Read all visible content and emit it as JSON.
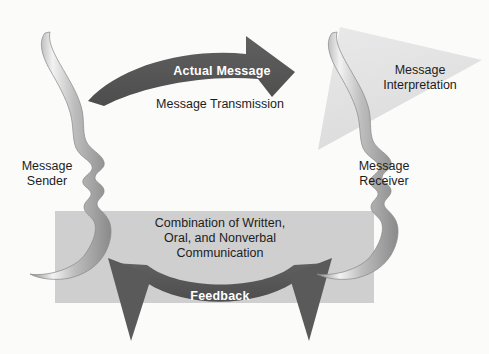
{
  "diagram": {
    "background_color": "#fbfbfa",
    "nodes": {
      "sender": {
        "label": "Message\nSender",
        "role": "human profile silhouette facing right",
        "side": "left"
      },
      "receiver": {
        "label": "Message\nReceiver",
        "role": "human profile silhouette facing right",
        "side": "right"
      }
    },
    "shapes": {
      "transmission_arrow": {
        "name": "Actual Message arrow",
        "direction": "left-to-right, curved arc, arrowhead down-right",
        "fill": "#595959",
        "inner_label": "Actual Message",
        "outer_label": "Message Transmission"
      },
      "interpretation_triangle": {
        "name": "Message Interpretation triangle",
        "direction": "downward pointing triangle",
        "fill": "#e2e2e2",
        "label": "Message\nInterpretation"
      },
      "channel_band": {
        "name": "Communication channel band",
        "fill": "#cfcfcf",
        "label": "Combination of Written,\nOral, and Nonverbal\nCommunication"
      },
      "feedback_arrow": {
        "name": "Feedback double-headed arc arrow",
        "direction": "bidirectional, arrowheads up-left and up-right",
        "fill": "#595959",
        "inner_label": "Feedback"
      }
    },
    "labels": {
      "actual_message": "Actual Message",
      "message_transmission": "Message Transmission",
      "message_interpretation": "Message\nInterpretation",
      "message_sender": "Message\nSender",
      "message_receiver": "Message\nReceiver",
      "channel_text": "Combination of Written,\nOral, and Nonverbal\nCommunication",
      "feedback": "Feedback"
    },
    "colors": {
      "arrow_dark": "#595959",
      "arrow_dark_shade": "#4a4a4a",
      "band_gray": "#cfcfcf",
      "triangle_gray": "#e2e2e2",
      "face_outline": "#8c8c8c",
      "face_highlight": "#ededed",
      "text_dark": "#1d1d1d",
      "text_light": "#ffffff",
      "background": "#fbfbfa"
    }
  }
}
